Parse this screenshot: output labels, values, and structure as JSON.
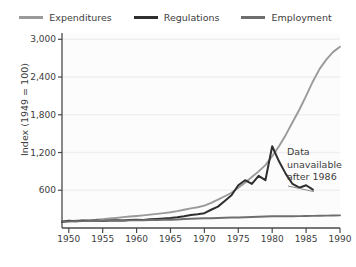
{
  "chart_data": {
    "type": "line",
    "title": "",
    "xlabel": "",
    "ylabel": "Index (1949 = 100)",
    "xlim": [
      1949,
      1990
    ],
    "ylim": [
      0,
      3100
    ],
    "grid": true,
    "legend_position": "top-center",
    "yticks": [
      "600",
      "1,200",
      "1,800",
      "2,400",
      "3,000"
    ],
    "ytick_values": [
      600,
      1200,
      1800,
      2400,
      3000
    ],
    "xticks": [
      "1950",
      "1955",
      "1960",
      "1965",
      "1970",
      "1975",
      "1980",
      "1985",
      "1990"
    ],
    "xtick_values": [
      1950,
      1955,
      1960,
      1965,
      1970,
      1975,
      1980,
      1985,
      1990
    ],
    "x": [
      1949,
      1950,
      1951,
      1952,
      1953,
      1954,
      1955,
      1956,
      1957,
      1958,
      1959,
      1960,
      1961,
      1962,
      1963,
      1964,
      1965,
      1966,
      1967,
      1968,
      1969,
      1970,
      1971,
      1972,
      1973,
      1974,
      1975,
      1976,
      1977,
      1978,
      1979,
      1980,
      1981,
      1982,
      1983,
      1984,
      1985,
      1986,
      1987,
      1988,
      1989,
      1990
    ],
    "series": [
      {
        "name": "Expenditures",
        "color": "#9a9a9a",
        "values": [
          100,
          110,
          118,
          124,
          128,
          132,
          140,
          150,
          160,
          172,
          182,
          190,
          200,
          212,
          224,
          236,
          250,
          268,
          290,
          312,
          330,
          355,
          400,
          450,
          505,
          560,
          640,
          720,
          810,
          900,
          1000,
          1140,
          1300,
          1480,
          1680,
          1880,
          2100,
          2330,
          2530,
          2680,
          2800,
          2880
        ]
      },
      {
        "name": "Regulations",
        "color": "#2f2f2f",
        "values": [
          100,
          115,
          108,
          116,
          110,
          118,
          112,
          120,
          124,
          118,
          126,
          132,
          128,
          138,
          144,
          150,
          158,
          170,
          186,
          205,
          218,
          235,
          290,
          340,
          430,
          520,
          680,
          760,
          700,
          830,
          760,
          1300,
          1060,
          860,
          700,
          640,
          680,
          610,
          null,
          null,
          null,
          null
        ]
      },
      {
        "name": "Employment",
        "color": "#6e6e6e",
        "values": [
          100,
          104,
          108,
          110,
          112,
          112,
          114,
          118,
          120,
          120,
          122,
          124,
          124,
          126,
          128,
          130,
          132,
          136,
          142,
          146,
          150,
          154,
          156,
          158,
          162,
          166,
          168,
          170,
          174,
          178,
          182,
          186,
          188,
          186,
          186,
          188,
          190,
          192,
          194,
          196,
          198,
          200
        ]
      }
    ],
    "annotations": [
      {
        "name": "data-unavailable-note",
        "lines": [
          "Data",
          "unavailable",
          "after 1986"
        ],
        "x": 1987,
        "y": 700
      }
    ]
  },
  "legend": {
    "items": [
      {
        "label": "Expenditures",
        "color": "#9a9a9a"
      },
      {
        "label": "Regulations",
        "color": "#2f2f2f"
      },
      {
        "label": "Employment",
        "color": "#6e6e6e"
      }
    ]
  }
}
